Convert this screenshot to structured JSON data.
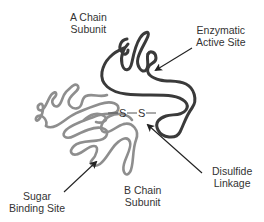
{
  "diagram": {
    "title": "",
    "colors": {
      "a_chain": "#3a3a3a",
      "b_chain": "#8e8e8e",
      "arrow": "#222222",
      "text": "#333333",
      "background": "#ffffff"
    },
    "labels": {
      "a_chain": {
        "line1": "A Chain",
        "line2": "Subunit"
      },
      "enzymatic_site": {
        "line1": "Enzymatic",
        "line2": "Active Site"
      },
      "disulfide": {
        "line1": "Disulfide",
        "line2": "Linkage"
      },
      "b_chain": {
        "line1": "B Chain",
        "line2": "Subunit"
      },
      "sugar_site": {
        "line1": "Sugar",
        "line2": "Binding Site"
      }
    },
    "bond": {
      "atom1": "S",
      "atom2": "S"
    }
  }
}
